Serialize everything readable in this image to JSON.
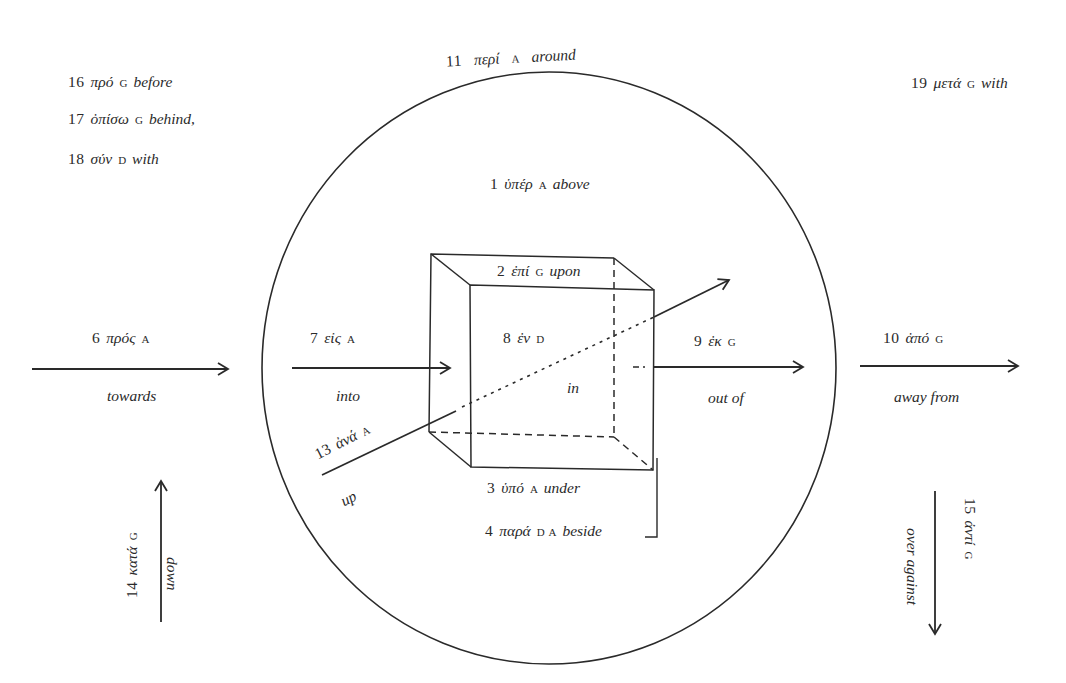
{
  "diagram": {
    "type": "preposition-spatial-diagram",
    "legend_case_marks": {
      "G": "genitive",
      "D": "dative",
      "A": "accusative"
    },
    "prepositions": [
      {
        "id": "p1",
        "num": "1",
        "greek": "ὑπέρ",
        "case": "A",
        "english": "above"
      },
      {
        "id": "p2",
        "num": "2",
        "greek": "ἐπί",
        "case": "G",
        "english": "upon"
      },
      {
        "id": "p3",
        "num": "3",
        "greek": "ὑπό",
        "case": "A",
        "english": "under"
      },
      {
        "id": "p4",
        "num": "4",
        "greek": "παρά",
        "case": "D A",
        "english": "beside"
      },
      {
        "id": "p6",
        "num": "6",
        "greek": "πρός",
        "case": "A",
        "english": "towards"
      },
      {
        "id": "p7",
        "num": "7",
        "greek": "εἰς",
        "case": "A",
        "english": "into"
      },
      {
        "id": "p8",
        "num": "8",
        "greek": "ἐν",
        "case": "D",
        "english": "in"
      },
      {
        "id": "p9",
        "num": "9",
        "greek": "ἐκ",
        "case": "G",
        "english": "out of"
      },
      {
        "id": "p10",
        "num": "10",
        "greek": "ἀπό",
        "case": "G",
        "english": "away from"
      },
      {
        "id": "p11",
        "num": "11",
        "greek": "περί",
        "case": "A",
        "english": "around"
      },
      {
        "id": "p12",
        "num": "12",
        "greek": "διά",
        "case": "G",
        "english": "through"
      },
      {
        "id": "p13",
        "num": "13",
        "greek": "ἀνά",
        "case": "A",
        "english": "up"
      },
      {
        "id": "p14",
        "num": "14",
        "greek": "κατά",
        "case": "G",
        "english": "down"
      },
      {
        "id": "p15",
        "num": "15",
        "greek": "ἀντί",
        "case": "G",
        "english": "over against"
      },
      {
        "id": "p16",
        "num": "16",
        "greek": "πρό",
        "case": "G",
        "english": "before"
      },
      {
        "id": "p17",
        "num": "17",
        "greek": "ὀπίσω",
        "case": "G",
        "english": "behind,",
        "english2": "after"
      },
      {
        "id": "p18",
        "num": "18",
        "greek": "σύν",
        "case": "D",
        "english": "with"
      },
      {
        "id": "p19",
        "num": "19",
        "greek": "μετά",
        "case": "G",
        "english": "with",
        "case2": "A",
        "english2": "after"
      }
    ]
  }
}
